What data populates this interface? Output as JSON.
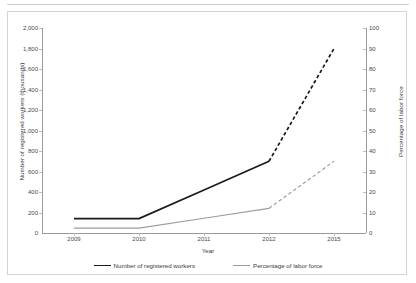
{
  "chart_data": {
    "type": "line",
    "title": "",
    "xlabel": "Year",
    "ylabel": "Number of registered workers (thousands)",
    "ylabel_secondary": "Percentage of labor force",
    "categories": [
      "2009",
      "2010",
      "2011",
      "2012",
      "2015"
    ],
    "ylim": [
      0,
      2000
    ],
    "ylim_secondary": [
      0,
      100
    ],
    "yticks": [
      "2,000",
      "1,800",
      "1,600",
      "1,400",
      "1,200",
      "1,000",
      "800",
      "600",
      "400",
      "200",
      "0"
    ],
    "yticks_secondary": [
      "100",
      "90",
      "80",
      "70",
      "60",
      "50",
      "40",
      "30",
      "20",
      "10",
      "0"
    ],
    "grid": false,
    "legend_position": "bottom",
    "series": [
      {
        "name": "Number of registered workers",
        "axis": "left",
        "color": "#1a1a1a",
        "values": [
          140,
          140,
          420,
          700,
          1800
        ],
        "solid_through_index": 3,
        "dashed_tail": true
      },
      {
        "name": "Percentage of labor force",
        "axis": "right",
        "color": "#9d9d9d",
        "values": [
          2.4,
          2.4,
          7.2,
          12,
          35
        ],
        "solid_through_index": 3,
        "dashed_tail": true
      }
    ]
  },
  "axes": {
    "left_label": "Number of registered workers (thousands)",
    "right_label": "Percentage of labor force",
    "x_label": "Year"
  },
  "legend": {
    "items": [
      {
        "label": "Number of registered workers"
      },
      {
        "label": "Percentage of labor force"
      }
    ]
  }
}
